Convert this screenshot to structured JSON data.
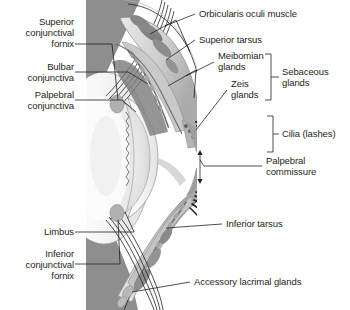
{
  "figure": {
    "type": "anatomical-illustration",
    "style": "grayscale medical illustration",
    "background_color": "#ffffff",
    "illustration_bounds": {
      "x": 86,
      "y": 0,
      "width": 110,
      "height": 310
    }
  },
  "labels": {
    "superior_conjunctival_fornix": "Superior\nconjunctival\nfornix",
    "bulbar_conjunctiva": "Bulbar\nconjunctiva",
    "palpebral_conjunctiva": "Palpebral\nconjunctiva",
    "limbus": "Limbus",
    "inferior_conjunctival_fornix": "Inferior\nconjunctival\nfornix",
    "orbicularis_oculi_muscle": "Orbicularis oculi muscle",
    "superior_tarsus": "Superior tarsus",
    "meibomian_glands": "Meibomian\nglands",
    "zeis_glands": "Zeis\nglands",
    "sebaceous_glands": "Sebaceous\nglands",
    "cilia_lashes": "Cilia (lashes)",
    "palpebral_commissure": "Palpebral\ncommissure",
    "inferior_tarsus": "Inferior tarsus",
    "accessory_lacrimal_glands": "Accessory lacrimal glands"
  },
  "colors": {
    "text": "#231f20",
    "leader_line": "#231f20",
    "sclera": "#f2f2f2",
    "cornea": "#fafafa",
    "lid_tissue": "#d9d9d9",
    "muscle_dark": "#8a8a8a",
    "tarsus_mid": "#b5b5b5",
    "deep_shadow": "#6e6e6e",
    "lash_black": "#1a1a1a"
  }
}
